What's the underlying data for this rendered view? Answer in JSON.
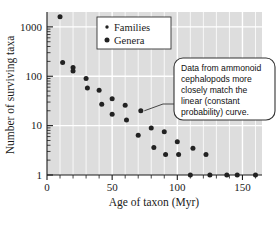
{
  "chart_data": {
    "type": "scatter",
    "title": "",
    "xlabel": "Age of taxon (Myr)",
    "ylabel": "Number of surviving taxa",
    "xlim": [
      0,
      165
    ],
    "ylim": [
      1,
      2000
    ],
    "yscale": "log",
    "xscale": "linear",
    "grid": true,
    "xticks": [
      0,
      50,
      100,
      150
    ],
    "xtick_labels": [
      "0",
      "50",
      "100",
      "150"
    ],
    "xminor_step": 10,
    "yticks": [
      1,
      10,
      100,
      1000
    ],
    "ytick_labels": [
      "1",
      "10",
      "100",
      "1000"
    ],
    "legend_position": "top-center",
    "series": [
      {
        "name": "Families",
        "marker": "small-dot",
        "points": []
      },
      {
        "name": "Genera",
        "marker": "dot",
        "points": [
          {
            "x": 10,
            "y": 1600
          },
          {
            "x": 12,
            "y": 190
          },
          {
            "x": 20,
            "y": 150
          },
          {
            "x": 20,
            "y": 128
          },
          {
            "x": 30,
            "y": 90
          },
          {
            "x": 31,
            "y": 58
          },
          {
            "x": 40,
            "y": 52
          },
          {
            "x": 42,
            "y": 27
          },
          {
            "x": 50,
            "y": 35
          },
          {
            "x": 50,
            "y": 17
          },
          {
            "x": 60,
            "y": 26
          },
          {
            "x": 61,
            "y": 13
          },
          {
            "x": 72,
            "y": 20
          },
          {
            "x": 70,
            "y": 6.4
          },
          {
            "x": 80,
            "y": 9
          },
          {
            "x": 82,
            "y": 3.6
          },
          {
            "x": 90,
            "y": 7.5
          },
          {
            "x": 91,
            "y": 2.6
          },
          {
            "x": 100,
            "y": 4.7
          },
          {
            "x": 101,
            "y": 2.6
          },
          {
            "x": 112,
            "y": 3.5
          },
          {
            "x": 122,
            "y": 2.6
          },
          {
            "x": 110,
            "y": 1
          },
          {
            "x": 125,
            "y": 1
          },
          {
            "x": 138,
            "y": 1
          },
          {
            "x": 146,
            "y": 1
          },
          {
            "x": 160,
            "y": 1
          }
        ]
      }
    ],
    "annotations": [
      {
        "name": "callout",
        "text": "Data from ammonoid cephalopods more closely match the linear (constant probability) curve.",
        "lines": [
          "Data from ammonoid",
          "cephalopods more",
          "closely match the",
          "linear (constant",
          "probability) curve."
        ],
        "points_to": {
          "x": 72,
          "y": 20
        }
      }
    ]
  },
  "legend": {
    "entries": [
      {
        "label": "Families"
      },
      {
        "label": "Genera"
      }
    ]
  },
  "colors": {
    "plot_background": "#dddddd",
    "gridline": "#ffffff",
    "marker": "#222222",
    "axis": "#1a1a1a",
    "callout_border": "#333333",
    "callout_background": "#ffffff",
    "page_background": "#ffffff"
  }
}
